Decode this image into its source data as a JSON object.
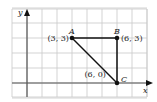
{
  "figure": {
    "axes": {
      "x_label": "x",
      "y_label": "y"
    },
    "grid": {
      "x_min": -1,
      "x_max": 8,
      "y_min": -1,
      "y_max": 5
    },
    "points": [
      {
        "name": "A",
        "x": 3,
        "y": 3,
        "coord_label": "(3, 3)",
        "label_side": "left"
      },
      {
        "name": "B",
        "x": 6,
        "y": 3,
        "coord_label": "(6, 3)",
        "label_side": "right"
      },
      {
        "name": "C",
        "x": 6,
        "y": 0,
        "coord_label": "(6, 0)",
        "label_side": "left"
      }
    ],
    "segments": [
      [
        "A",
        "B"
      ],
      [
        "B",
        "C"
      ],
      [
        "C",
        "A"
      ]
    ],
    "colors": {
      "grid": "#c8c8c8",
      "axis": "#555555",
      "shape": "#111111"
    }
  }
}
